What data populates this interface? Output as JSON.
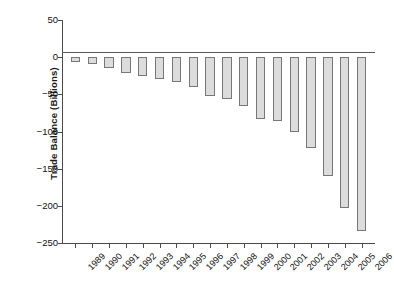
{
  "chart_data": {
    "type": "bar",
    "title": "",
    "xlabel": "",
    "ylabel": "Trade Balance (Billions)",
    "categories": [
      "1989",
      "1990",
      "1991",
      "1992",
      "1993",
      "1994",
      "1995",
      "1996",
      "1997",
      "1998",
      "1999",
      "2000",
      "2001",
      "2002",
      "2003",
      "2004",
      "2005",
      "2006"
    ],
    "values": [
      -7,
      -9,
      -14,
      -21,
      -25,
      -30,
      -34,
      -40,
      -52,
      -56,
      -66,
      -83,
      -86,
      -101,
      -122,
      -160,
      -203,
      -234
    ],
    "ylim": [
      -250,
      50
    ],
    "yticks": [
      50,
      0,
      -50,
      -100,
      -150,
      -200,
      -250
    ],
    "ytick_labels": [
      "50",
      "0",
      "−50",
      "−100",
      "−150",
      "−200",
      "−250"
    ],
    "grid": false,
    "legend": null,
    "bar_fill_color": "#dcdcdc",
    "bar_edge_color": "#777777",
    "axis_color": "#4a4a4a"
  }
}
